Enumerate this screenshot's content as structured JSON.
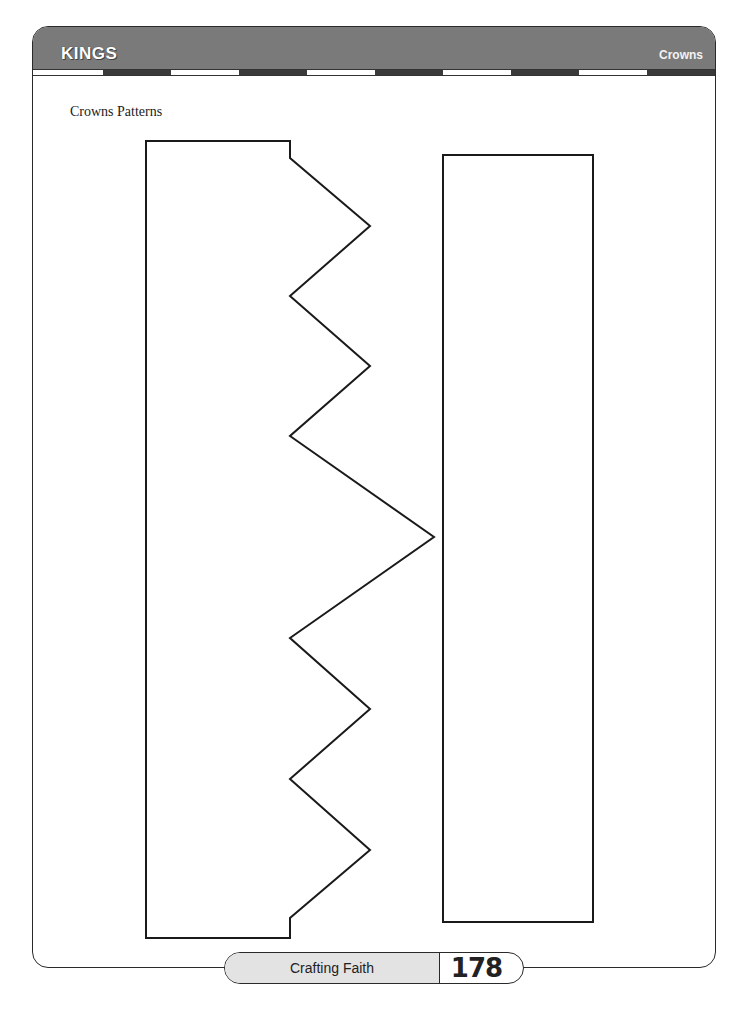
{
  "header": {
    "title": "KINGS",
    "section": "Crowns",
    "bar_color": "#7a7a7a"
  },
  "content": {
    "section_label": "Crowns Patterns",
    "patterns": [
      {
        "name": "crown-front-pattern",
        "shape": "zigzag-polygon",
        "points": [
          [
            146,
            141
          ],
          [
            290,
            141
          ],
          [
            290,
            158
          ],
          [
            370,
            226
          ],
          [
            290,
            296
          ],
          [
            370,
            366
          ],
          [
            290,
            436
          ],
          [
            434,
            537
          ],
          [
            290,
            638
          ],
          [
            370,
            709
          ],
          [
            290,
            779
          ],
          [
            370,
            850
          ],
          [
            290,
            918
          ],
          [
            290,
            938
          ],
          [
            146,
            938
          ]
        ]
      },
      {
        "name": "crown-band-pattern",
        "shape": "rectangle",
        "x": 443,
        "y": 155,
        "width": 150,
        "height": 767
      }
    ]
  },
  "footer": {
    "label": "Crafting Faith",
    "page_number": "178"
  }
}
